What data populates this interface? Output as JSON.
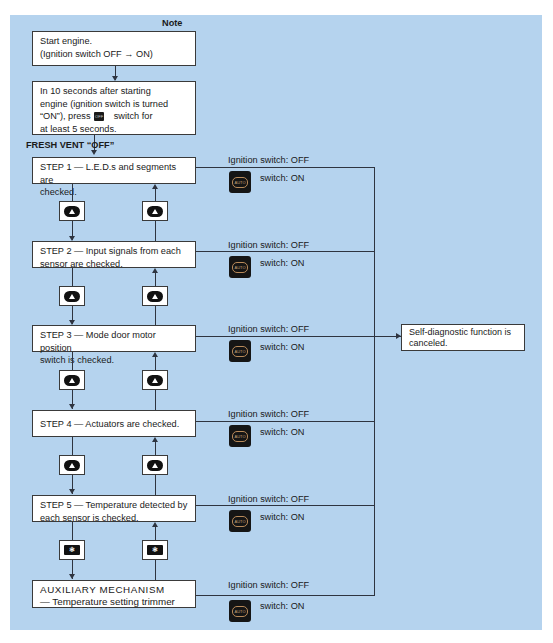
{
  "header": {
    "note": "Note"
  },
  "start_box": {
    "line1": "Start engine.",
    "line2": "(Ignition switch OFF → ON)"
  },
  "press_box": {
    "line1": "In 10 seconds after starting",
    "line2": "engine (ignition switch is turned",
    "line3_pre": "“ON”), press",
    "line3_icon": "OFF",
    "line3_post": "switch for",
    "line4": "at least 5 seconds."
  },
  "fresh_vent_label": "FRESH VENT “OFF”",
  "steps": [
    {
      "line1": "STEP 1 — L.E.D.s and segments are",
      "line2": "checked."
    },
    {
      "line1": "STEP 2 — Input signals from each",
      "line2": "sensor are checked."
    },
    {
      "line1": "STEP 3 — Mode door motor position",
      "line2": "switch  is checked."
    },
    {
      "line1": "STEP 4 — Actuators are checked.",
      "line2": ""
    },
    {
      "line1": "STEP 5 — Temperature detected by",
      "line2": "each sensor is checked."
    },
    {
      "line1": "AUXILIARY MECHANISM",
      "line2": "— Temperature setting trimmer"
    }
  ],
  "exit_conditions": {
    "ignition": "Ignition switch:  OFF",
    "auto_switch": "switch:  ON",
    "auto_icon_label": "AUTO"
  },
  "cancel_box": {
    "line1": "Self-diagnostic function is",
    "line2": "canceled."
  },
  "buttons": {
    "up_icon": "up-triangle",
    "fan_icon": "fan",
    "fan_glyph": "❃"
  },
  "colors": {
    "panel_bg": "#b5d3ee",
    "line": "#2e3440",
    "box_bg": "#ffffff"
  }
}
